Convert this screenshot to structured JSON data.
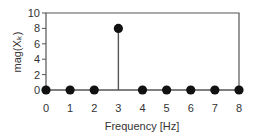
{
  "chart_data": {
    "type": "stem",
    "title": "",
    "xlabel": "Frequency [Hz]",
    "ylabel": "mag(Xₖ)",
    "x": [
      0,
      1,
      2,
      3,
      4,
      5,
      6,
      7,
      8
    ],
    "values": [
      0,
      0,
      0,
      8,
      0,
      0,
      0,
      0,
      0
    ],
    "xlim": [
      0,
      8
    ],
    "ylim": [
      0,
      10
    ],
    "xticks": [
      "0",
      "1",
      "2",
      "3",
      "4",
      "5",
      "6",
      "7",
      "8"
    ],
    "yticks": [
      "0",
      "2",
      "4",
      "6",
      "8",
      "10"
    ],
    "grid": false,
    "legend": null
  },
  "colors": {
    "stem": "#555555",
    "marker": "#111111",
    "frame": "#555555",
    "text": "#333333"
  }
}
